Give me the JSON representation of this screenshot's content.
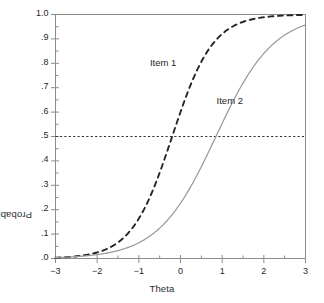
{
  "chart_data": {
    "type": "line",
    "title": "",
    "xlabel": "Theta",
    "ylabel": "Probability",
    "xlim": [
      -3,
      3
    ],
    "ylim": [
      0,
      1
    ],
    "grid": false,
    "legend_position": "inline-annotations",
    "xticks": [
      -3,
      -2,
      -1,
      0,
      1,
      2,
      3
    ],
    "xtick_labels": [
      "−3",
      "−2",
      "−1",
      "0",
      "1",
      "2",
      "3"
    ],
    "xminor_tick_step": 0.5,
    "yticks": [
      0,
      0.1,
      0.2,
      0.3,
      0.4,
      0.5,
      0.6,
      0.7,
      0.8,
      0.9,
      1.0
    ],
    "ytick_labels": [
      ".0",
      ".1",
      ".2",
      ".3",
      ".4",
      ".5",
      ".6",
      ".7",
      ".8",
      ".9",
      "1.0"
    ],
    "yminor_tick_step": 0.05,
    "reference_lines": [
      {
        "name": "half-probability",
        "orientation": "horizontal",
        "value": 0.5,
        "style": "dotted",
        "color": "#333333"
      }
    ],
    "annotations": [
      {
        "text": "Item 1",
        "x": -0.35,
        "y": 0.8
      },
      {
        "text": "Item 2",
        "x": 1.25,
        "y": 0.645
      }
    ],
    "series": [
      {
        "name": "Item 1",
        "style": "dashed",
        "color": "#262626",
        "model": "2PL logistic",
        "discrimination": 1.2,
        "difficulty": -0.2,
        "x": [
          -3,
          -2.75,
          -2.5,
          -2.25,
          -2,
          -1.75,
          -1.5,
          -1.25,
          -1,
          -0.75,
          -0.5,
          -0.25,
          0,
          0.25,
          0.5,
          0.75,
          1,
          1.25,
          1.5,
          1.75,
          2,
          2.25,
          2.5,
          2.75,
          3
        ],
        "values": [
          0.05,
          0.06,
          0.07,
          0.09,
          0.11,
          0.13,
          0.16,
          0.2,
          0.24,
          0.28,
          0.34,
          0.4,
          0.46,
          0.53,
          0.59,
          0.65,
          0.71,
          0.76,
          0.8,
          0.84,
          0.87,
          0.9,
          0.92,
          0.94,
          0.95
        ]
      },
      {
        "name": "Item 2",
        "style": "solid",
        "color": "#9a9a9a",
        "model": "2PL logistic",
        "discrimination": 0.85,
        "difficulty": 0.85,
        "x": [
          -3,
          -2.75,
          -2.5,
          -2.25,
          -2,
          -1.75,
          -1.5,
          -1.25,
          -1,
          -0.75,
          -0.5,
          -0.25,
          0,
          0.25,
          0.5,
          0.75,
          1,
          1.25,
          1.5,
          1.75,
          2,
          2.25,
          2.5,
          2.75,
          3
        ],
        "values": [
          0.02,
          0.025,
          0.03,
          0.04,
          0.05,
          0.06,
          0.07,
          0.09,
          0.12,
          0.15,
          0.18,
          0.22,
          0.27,
          0.32,
          0.38,
          0.44,
          0.5,
          0.56,
          0.62,
          0.68,
          0.73,
          0.78,
          0.82,
          0.85,
          0.88
        ]
      }
    ],
    "crossings_at_half": [
      {
        "series": "Item 1",
        "theta": -0.2
      },
      {
        "series": "Item 2",
        "theta": 0.85
      }
    ],
    "colors": {
      "frame": "#8c8c8c",
      "item1": "#262626",
      "item2": "#9a9a9a",
      "reference": "#333333",
      "text": "#1f1f1f",
      "background": "#ffffff"
    }
  }
}
